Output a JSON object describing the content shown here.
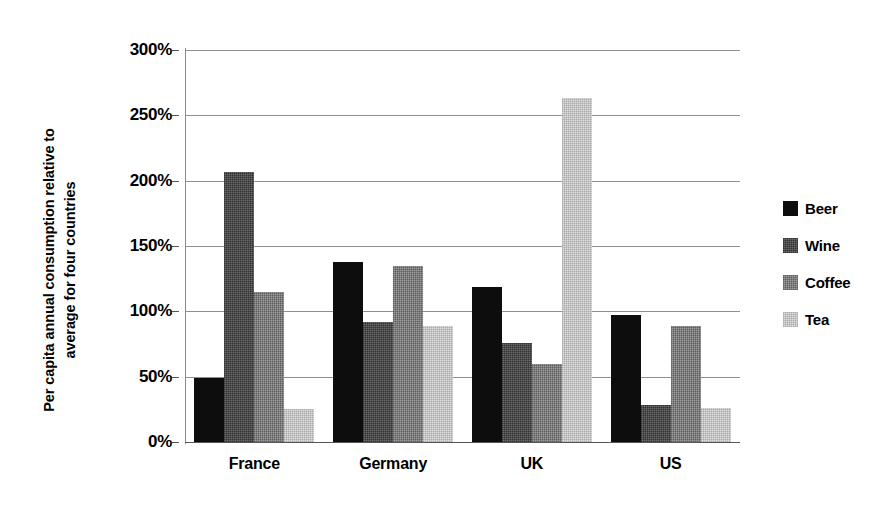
{
  "chart_data": {
    "type": "bar",
    "title": "",
    "xlabel": "",
    "ylabel": "Per capita annual consumption relative to average for four countries",
    "ylabel_lines": [
      "Per capita annual consumption relative to",
      "average for four countries"
    ],
    "categories": [
      "France",
      "Germany",
      "UK",
      "US"
    ],
    "series": [
      {
        "name": "Beer",
        "color": "#0d0d0d",
        "values": [
          49,
          138,
          119,
          97
        ]
      },
      {
        "name": "Wine",
        "color": "#6b6b6b",
        "values": [
          207,
          92,
          76,
          28
        ]
      },
      {
        "name": "Coffee",
        "color": "#9d9d9d",
        "values": [
          115,
          135,
          60,
          89
        ]
      },
      {
        "name": "Tea",
        "color": "#dedede",
        "values": [
          25,
          89,
          263,
          26
        ]
      }
    ],
    "ylim": [
      0,
      300
    ],
    "y_ticks": [
      0,
      50,
      100,
      150,
      200,
      250,
      300
    ],
    "y_tick_labels": [
      "0%",
      "50%",
      "100%",
      "150%",
      "200%",
      "250%",
      "300%"
    ],
    "value_unit": "%",
    "grid": true,
    "legend_position": "right"
  }
}
